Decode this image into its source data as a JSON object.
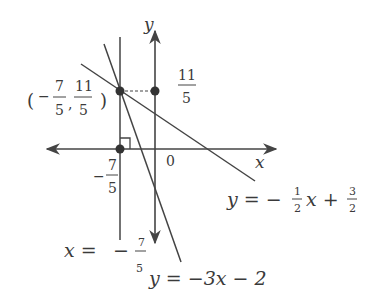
{
  "diagram": {
    "type": "coordinate-plane",
    "axes": {
      "x_label": "x",
      "y_label": "y",
      "origin_label": "0"
    },
    "lines": [
      {
        "id": "vertical",
        "equation_lhs": "x =",
        "equation_sign": "−",
        "equation_num": "7",
        "equation_den": "5"
      },
      {
        "id": "shallow",
        "equation_lhs": "y = −",
        "coef_num": "1",
        "coef_den": "2",
        "mid": "x +",
        "const_num": "3",
        "const_den": "2"
      },
      {
        "id": "steep",
        "equation": "y = −3x − 2"
      }
    ],
    "intersection_point": {
      "open": "(",
      "x_sign": "−",
      "x_num": "7",
      "x_den": "5",
      "comma": ",",
      "y_num": "11",
      "y_den": "5",
      "close": ")"
    },
    "y_axis_tick": {
      "num": "11",
      "den": "5"
    },
    "x_axis_tick": {
      "sign": "−",
      "num": "7",
      "den": "5"
    },
    "colors": {
      "line": "#444444",
      "text": "#3a3a3a",
      "background": "#ffffff"
    }
  }
}
